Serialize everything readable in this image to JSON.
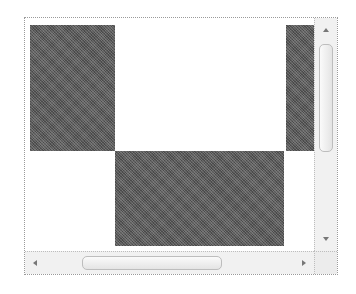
{
  "scroll_view": {
    "content": {
      "pattern": "checkerboard",
      "dark_color": "#5a5a5a",
      "light_color": "#ffffff",
      "blocks": [
        {
          "name": "top-left-dark-block",
          "x": 5,
          "y": 7,
          "w": 85,
          "h": 126
        },
        {
          "name": "top-right-dark-strip",
          "x": 261,
          "y": 7,
          "w": 28,
          "h": 126
        },
        {
          "name": "bottom-center-dark-block",
          "x": 90,
          "y": 133,
          "w": 169,
          "h": 95
        }
      ]
    },
    "vertical_scrollbar": {
      "up_arrow": "arrow-up-icon",
      "down_arrow": "arrow-down-icon",
      "thumb_position_pct": 12
    },
    "horizontal_scrollbar": {
      "left_arrow": "arrow-left-icon",
      "right_arrow": "arrow-right-icon",
      "thumb_position_pct": 24
    }
  }
}
